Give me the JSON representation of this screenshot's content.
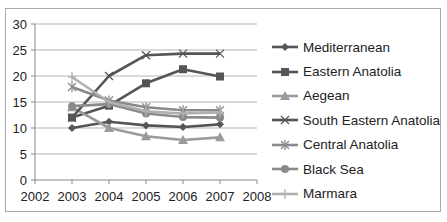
{
  "chart_data": {
    "type": "line",
    "title": "",
    "xlabel": "",
    "ylabel": "",
    "x": [
      2003,
      2004,
      2005,
      2006,
      2007
    ],
    "xlim": [
      2002,
      2008
    ],
    "ylim": [
      0,
      30
    ],
    "x_ticks": [
      "2002",
      "2003",
      "2004",
      "2005",
      "2006",
      "2007",
      "2008"
    ],
    "y_ticks": [
      "0",
      "5",
      "10",
      "15",
      "20",
      "25",
      "30"
    ],
    "grid": "horizontal",
    "legend_position": "right",
    "series": [
      {
        "name": "Mediterranean",
        "marker": "diamond",
        "color": "#555555",
        "values": [
          10.0,
          11.2,
          10.5,
          10.2,
          10.7
        ]
      },
      {
        "name": "Eastern Anatolia",
        "marker": "square",
        "color": "#555555",
        "values": [
          12.0,
          14.3,
          18.6,
          21.3,
          19.9
        ]
      },
      {
        "name": "Aegean",
        "marker": "triangle",
        "color": "#9a9a9a",
        "values": [
          14.0,
          10.0,
          8.4,
          7.7,
          8.2
        ]
      },
      {
        "name": "South Eastern Anatolia",
        "marker": "x",
        "color": "#555555",
        "values": [
          12.0,
          20.0,
          24.0,
          24.3,
          24.3
        ]
      },
      {
        "name": "Central Anatolia",
        "marker": "star",
        "color": "#8a8a8a",
        "values": [
          17.9,
          15.3,
          14.0,
          13.4,
          13.4
        ]
      },
      {
        "name": "Black Sea",
        "marker": "circle",
        "color": "#8a8a8a",
        "values": [
          14.2,
          14.6,
          12.8,
          12.1,
          12.0
        ]
      },
      {
        "name": "Marmara",
        "marker": "plus",
        "color": "#b0b0b0",
        "values": [
          19.8,
          15.0,
          13.2,
          12.8,
          13.0
        ]
      }
    ]
  }
}
